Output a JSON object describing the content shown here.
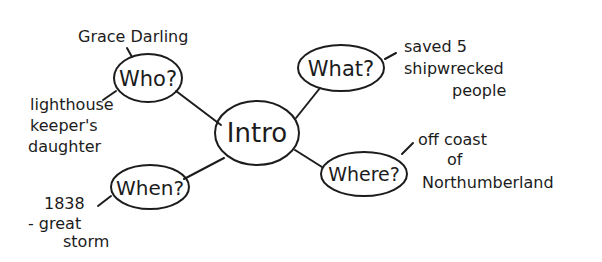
{
  "diagram": {
    "type": "mind-map",
    "style": "hand-drawn",
    "colors": {
      "ink": "#1c1c1c",
      "background": "#ffffff"
    },
    "center": {
      "label": "Intro"
    },
    "branches": [
      {
        "id": "who",
        "label": "Who?",
        "notes": [
          {
            "lines": [
              "Grace Darling"
            ]
          },
          {
            "lines": [
              "lighthouse",
              "keeper's",
              "daughter"
            ]
          }
        ]
      },
      {
        "id": "what",
        "label": "What?",
        "notes": [
          {
            "lines": [
              "saved 5",
              "shipwrecked",
              "people"
            ]
          }
        ]
      },
      {
        "id": "where",
        "label": "Where?",
        "notes": [
          {
            "lines": [
              "off coast",
              "of",
              "Northumberland"
            ]
          }
        ]
      },
      {
        "id": "when",
        "label": "When?",
        "notes": [
          {
            "lines": [
              "1838",
              "- great",
              "storm"
            ]
          }
        ]
      }
    ]
  }
}
